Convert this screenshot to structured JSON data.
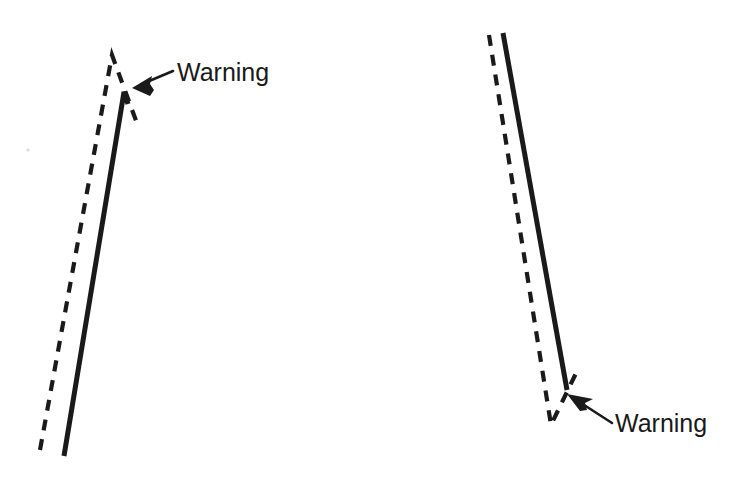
{
  "figure": {
    "title": "Warning annotation on paired solid and dashed traces",
    "width": 737,
    "height": 480,
    "background_color": "#ffffff",
    "ink_color": "#1a1a1a",
    "label_color": "#1a1a1a",
    "label_font_size_px": 25,
    "solid_stroke_width_px": 5,
    "dashed_stroke_width_px": 4.2,
    "dash_pattern": "11 9",
    "panels": [
      {
        "name": "left-panel",
        "description": "Two nearly parallel rising traces; dashed peaks higher and earlier than solid, both then turn sharply downward. Arrow points left at the divergence point.",
        "solid_trace": {
          "name": "solid-trace-left",
          "points": [
            [
              64,
              456
            ],
            [
              124,
              92
            ],
            [
              128,
              104
            ]
          ]
        },
        "dashed_trace": {
          "name": "dashed-trace-left",
          "points": [
            [
              40,
              450
            ],
            [
              112,
              55
            ],
            [
              138,
              126
            ]
          ]
        },
        "annotation": {
          "label": "Warning",
          "label_x": 177,
          "label_baseline_y": 81,
          "arrow_tip": [
            132,
            88
          ],
          "arrow_tail": [
            173,
            71
          ],
          "arrow_direction": "left"
        }
      },
      {
        "name": "right-panel",
        "description": "Two nearly parallel descending traces; solid ends mid-fall while dashed continues to a sharp V bottom and kicks back up to the right. Arrow points up-left at the divergence point.",
        "solid_trace": {
          "name": "solid-trace-right",
          "points": [
            [
              503,
              33
            ],
            [
              567,
              390
            ]
          ]
        },
        "dashed_trace": {
          "name": "dashed-trace-right",
          "points": [
            [
              489,
              35
            ],
            [
              551,
              425
            ],
            [
              579,
              367
            ]
          ]
        },
        "annotation": {
          "label": "Warning",
          "label_x": 615,
          "label_baseline_y": 432,
          "arrow_tip": [
            567,
            394
          ],
          "arrow_tail": [
            612,
            423
          ],
          "arrow_direction": "up-left"
        }
      }
    ]
  }
}
